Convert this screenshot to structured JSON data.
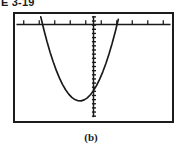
{
  "figure": {
    "number_label": "E 3-19",
    "subfigure_caption": "(b)",
    "style": {
      "frame_color": "#1c1c1c",
      "axis_color": "#1a1a1a",
      "curve_color": "#1a1a1a",
      "background_color": "#ffffff"
    }
  },
  "window": {
    "name": "graphing-calculator-viewing-window",
    "x_axis": {
      "label": "",
      "tick_count": 10,
      "tick_direction": "up",
      "screen_y_fraction": 0.1,
      "visible": true
    },
    "y_axis": {
      "label": "",
      "tick_count": 24,
      "tick_direction": "right",
      "screen_x_fraction": 0.513,
      "visible": true
    }
  },
  "chart_data": {
    "type": "line",
    "title": "",
    "subtitle": "",
    "xlabel": "",
    "ylabel": "",
    "grid": false,
    "legend": [],
    "legend_position": "none",
    "xlim": [
      -10,
      10
    ],
    "ylim": [
      -10,
      1.1
    ],
    "xticks": [
      -9,
      -7,
      -5,
      -3,
      -1,
      1,
      3,
      5,
      7,
      9
    ],
    "yticks": [],
    "annotations": [
      "upward-opening parabola",
      "vertex below x-axis on the y-axis",
      "both branches exit through the top of the window"
    ],
    "series": [
      {
        "name": "parabola",
        "color": "#1a1a1a",
        "x": [
          -6.8,
          -6.4,
          -6.0,
          -5.6,
          -5.2,
          -4.8,
          -4.4,
          -4.0,
          -3.6,
          -3.2,
          -2.8,
          -2.4,
          -2.0,
          -1.6,
          -1.2,
          -0.8,
          -0.4,
          0.0,
          0.4,
          0.8,
          1.2,
          1.6,
          2.0,
          2.4,
          2.8,
          3.2,
          3.6,
          4.0,
          4.4,
          4.8,
          5.2,
          5.6,
          6.0,
          6.4,
          6.8,
          7.2,
          7.6,
          7.9
        ],
        "y": [
          0.8,
          -0.53,
          -1.75,
          -2.86,
          -3.86,
          -4.75,
          -5.53,
          -6.2,
          -6.76,
          -7.21,
          -7.55,
          -7.78,
          -7.9,
          -7.91,
          -7.81,
          -7.6,
          -7.28,
          -6.85,
          -6.31,
          -5.66,
          -4.9,
          -4.03,
          -3.05,
          -1.96,
          -0.76,
          0.55,
          1.97,
          3.5,
          5.14,
          6.89,
          8.75,
          10.72,
          12.8,
          14.99,
          17.29,
          19.7,
          22.22,
          24.2
        ]
      }
    ],
    "vertex": {
      "x": 0.0,
      "y": -7.9
    }
  }
}
